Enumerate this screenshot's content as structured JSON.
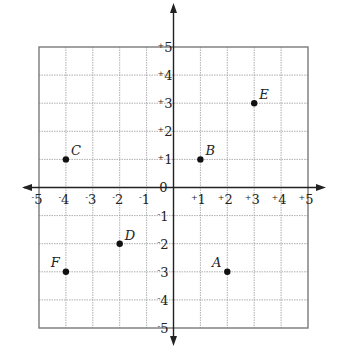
{
  "chart_data": {
    "type": "scatter",
    "title": "",
    "xlabel": "",
    "ylabel": "",
    "xlim": [
      -5,
      5
    ],
    "ylim": [
      -5,
      5
    ],
    "grid": true,
    "origin_label": "0",
    "x_ticks": [
      {
        "value": -5,
        "sign": "-",
        "num": "5"
      },
      {
        "value": -4,
        "sign": "-",
        "num": "4"
      },
      {
        "value": -3,
        "sign": "-",
        "num": "3"
      },
      {
        "value": -2,
        "sign": "-",
        "num": "2"
      },
      {
        "value": -1,
        "sign": "-",
        "num": "1"
      },
      {
        "value": 1,
        "sign": "+",
        "num": "1"
      },
      {
        "value": 2,
        "sign": "+",
        "num": "2"
      },
      {
        "value": 3,
        "sign": "+",
        "num": "3"
      },
      {
        "value": 4,
        "sign": "+",
        "num": "4"
      },
      {
        "value": 5,
        "sign": "+",
        "num": "5"
      }
    ],
    "y_ticks": [
      {
        "value": 5,
        "sign": "+",
        "num": "5"
      },
      {
        "value": 4,
        "sign": "+",
        "num": "4"
      },
      {
        "value": 3,
        "sign": "+",
        "num": "3"
      },
      {
        "value": 2,
        "sign": "+",
        "num": "2"
      },
      {
        "value": 1,
        "sign": "+",
        "num": "1"
      },
      {
        "value": -1,
        "sign": "-",
        "num": "1"
      },
      {
        "value": -2,
        "sign": "-",
        "num": "2"
      },
      {
        "value": -3,
        "sign": "-",
        "num": "3"
      },
      {
        "value": -4,
        "sign": "-",
        "num": "4"
      },
      {
        "value": -5,
        "sign": "-",
        "num": "5"
      }
    ],
    "points": [
      {
        "label": "A",
        "x": 2,
        "y": -3,
        "label_pos": "upper-left"
      },
      {
        "label": "B",
        "x": 1,
        "y": 1,
        "label_pos": "upper-right"
      },
      {
        "label": "C",
        "x": -4,
        "y": 1,
        "label_pos": "upper-right"
      },
      {
        "label": "D",
        "x": -2,
        "y": -2,
        "label_pos": "upper-right"
      },
      {
        "label": "E",
        "x": 3,
        "y": 3,
        "label_pos": "upper-right"
      },
      {
        "label": "F",
        "x": -4,
        "y": -3,
        "label_pos": "upper-left"
      }
    ],
    "colors": {
      "grid": "#9a9a9a",
      "border": "#7a7a7a",
      "axis": "#222222",
      "point": "#111111"
    }
  }
}
